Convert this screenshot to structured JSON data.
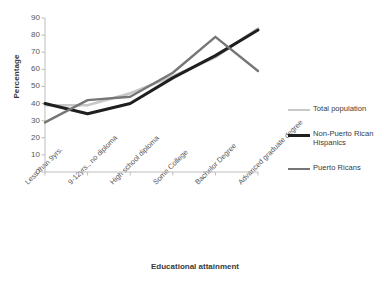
{
  "chart_data": {
    "type": "line",
    "title": "",
    "xlabel": "Educational attainment",
    "ylabel": "Percentage",
    "categories": [
      "Less than 9yrs.",
      "9-12yrs., no diploma",
      "High school diploma",
      "Some College",
      "Bachelor Degree",
      "Advanced graduate degree"
    ],
    "ylim": [
      0,
      90
    ],
    "ytick_step": 10,
    "yticks": [
      0,
      10,
      20,
      30,
      40,
      50,
      60,
      70,
      80,
      90
    ],
    "grid": false,
    "legend_position": "right",
    "series": [
      {
        "name": "Total population",
        "color": "#c8c8c8",
        "width": 2.6,
        "values": [
          39,
          39,
          46,
          56,
          67,
          84
        ]
      },
      {
        "name": "Non-Puerto Rican Hispanics",
        "color": "#1f1f1f",
        "width": 3.0,
        "values": [
          40,
          34,
          40,
          55,
          68,
          83
        ]
      },
      {
        "name": "Puerto Ricans",
        "color": "#767676",
        "width": 2.4,
        "values": [
          29,
          42,
          44,
          58,
          79,
          59
        ]
      }
    ]
  },
  "axis": {
    "line_color": "#bdbdbd",
    "tick_color": "#bdbdbd"
  }
}
